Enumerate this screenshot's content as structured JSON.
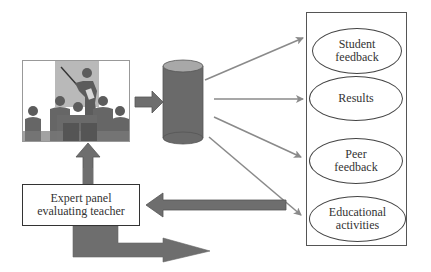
{
  "diagram": {
    "nodes": {
      "classroom_image": {
        "label": "",
        "icon": "teacher-presenting-to-class-icon"
      },
      "database": {
        "label": "",
        "icon": "database-cylinder-icon"
      },
      "expert_panel": {
        "label": "Expert panel evaluating teacher"
      },
      "outputs": [
        {
          "label": "Student feedback"
        },
        {
          "label": "Results"
        },
        {
          "label": "Peer feedback"
        },
        {
          "label": "Educational activities"
        }
      ]
    },
    "edges": [
      {
        "from": "classroom_image",
        "to": "database",
        "style": "block-arrow"
      },
      {
        "from": "database",
        "to": "Student feedback",
        "style": "line-arrow"
      },
      {
        "from": "database",
        "to": "Results",
        "style": "line-arrow"
      },
      {
        "from": "database",
        "to": "Peer feedback",
        "style": "line-arrow"
      },
      {
        "from": "database",
        "to": "Educational activities",
        "style": "line-arrow"
      },
      {
        "from": "outputs_box",
        "to": "expert_panel",
        "style": "block-arrow"
      },
      {
        "from": "expert_panel",
        "to": "classroom_image",
        "style": "block-arrow"
      },
      {
        "from": "expert_panel",
        "to": "outward",
        "style": "bent-block-arrow"
      }
    ],
    "colors": {
      "arrow_fill": "#6e6e6e",
      "arrow_stroke": "#555555",
      "cylinder_body": "#6a6a6a",
      "cylinder_top": "#a8a8a8",
      "line_arrow": "#8a8a8a",
      "photo_backdrop": "#b9b9b9",
      "figure": "#5c5c5c"
    }
  }
}
